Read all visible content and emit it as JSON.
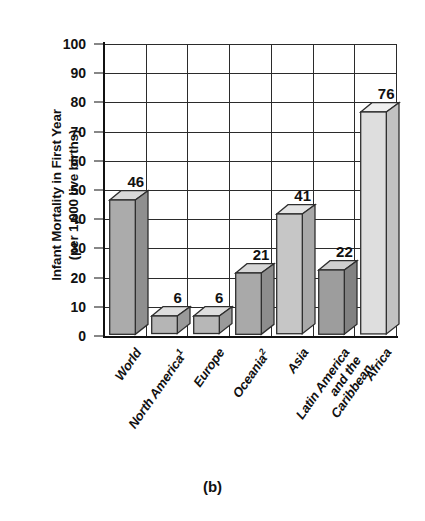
{
  "chart_data": {
    "type": "bar",
    "title": "",
    "caption": "(b)",
    "xlabel": "",
    "ylabel_line1": "Infant Mortality in First Year",
    "ylabel_line2": "(per 1,000 live births)",
    "categories": [
      "World",
      "North America¹",
      "Europe",
      "Oceania²",
      "Asia",
      "Latin America and the Caribbean",
      "Africa"
    ],
    "category_lines": [
      [
        "World"
      ],
      [
        "North America¹"
      ],
      [
        "Europe"
      ],
      [
        "Oceania²"
      ],
      [
        "Asia"
      ],
      [
        "Latin America",
        "and the",
        "Caribbean"
      ],
      [
        "Africa"
      ]
    ],
    "values": [
      46,
      6,
      6,
      21,
      41,
      22,
      76
    ],
    "value_labels": [
      "46",
      "6",
      "6",
      "21",
      "41",
      "22",
      "76"
    ],
    "ylim": [
      0,
      100
    ],
    "yticks": [
      0,
      10,
      20,
      30,
      40,
      50,
      60,
      70,
      80,
      90,
      100
    ],
    "ytick_labels": [
      "0",
      "10",
      "20",
      "30",
      "40",
      "50",
      "60",
      "70",
      "80",
      "90",
      "100"
    ],
    "grid": "both",
    "legend": "none",
    "bar_fills": [
      "#ababab",
      "#b5b5b5",
      "#b7b7b7",
      "#a9a9a9",
      "#c6c6c6",
      "#9d9d9d",
      "#dedede"
    ],
    "bar_top_fills": [
      "#d9d9d9",
      "#dedede",
      "#dedede",
      "#d6d6d6",
      "#e4e4e4",
      "#cfcfcf",
      "#efefef"
    ],
    "bar_side_fills": [
      "#8f8f8f",
      "#9a9a9a",
      "#9a9a9a",
      "#8d8d8d",
      "#a8a8a8",
      "#828282",
      "#c2c2c2"
    ],
    "axis_color": "#111111",
    "grid_color": "#2b2b2b",
    "background": "#ffffff"
  }
}
